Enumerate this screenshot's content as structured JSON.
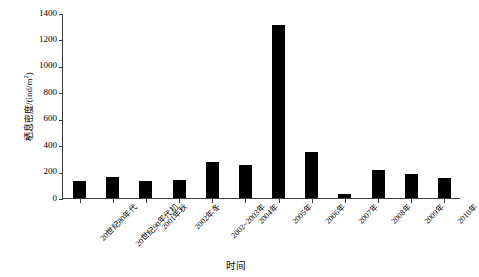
{
  "chart_data": {
    "type": "bar",
    "title": "",
    "xlabel": "时间",
    "ylabel": "栖息密度/(ind/m²)",
    "ylabel_main": "栖息密度/(ind/m",
    "ylabel_sup": "2",
    "ylabel_tail": ")",
    "ylim": [
      0,
      1400
    ],
    "ytick_values": [
      0,
      200,
      400,
      600,
      800,
      1000,
      1200,
      1400
    ],
    "ytick_labels": [
      "0",
      "200",
      "400",
      "600",
      "800",
      "1000",
      "1200",
      "1400"
    ],
    "grid": false,
    "legend": "none",
    "bar_color": "#000000",
    "axis_color": "#3a3a3a",
    "categories": [
      "20世纪80年代",
      "20世纪90年代初",
      "2001年秋",
      "2002年冬",
      "2002~2003年",
      "2004年",
      "2005年",
      "2006年",
      "2007年",
      "2008年",
      "2009年",
      "2010年"
    ],
    "values": [
      125,
      160,
      130,
      135,
      272,
      250,
      1310,
      345,
      30,
      210,
      185,
      150
    ]
  }
}
